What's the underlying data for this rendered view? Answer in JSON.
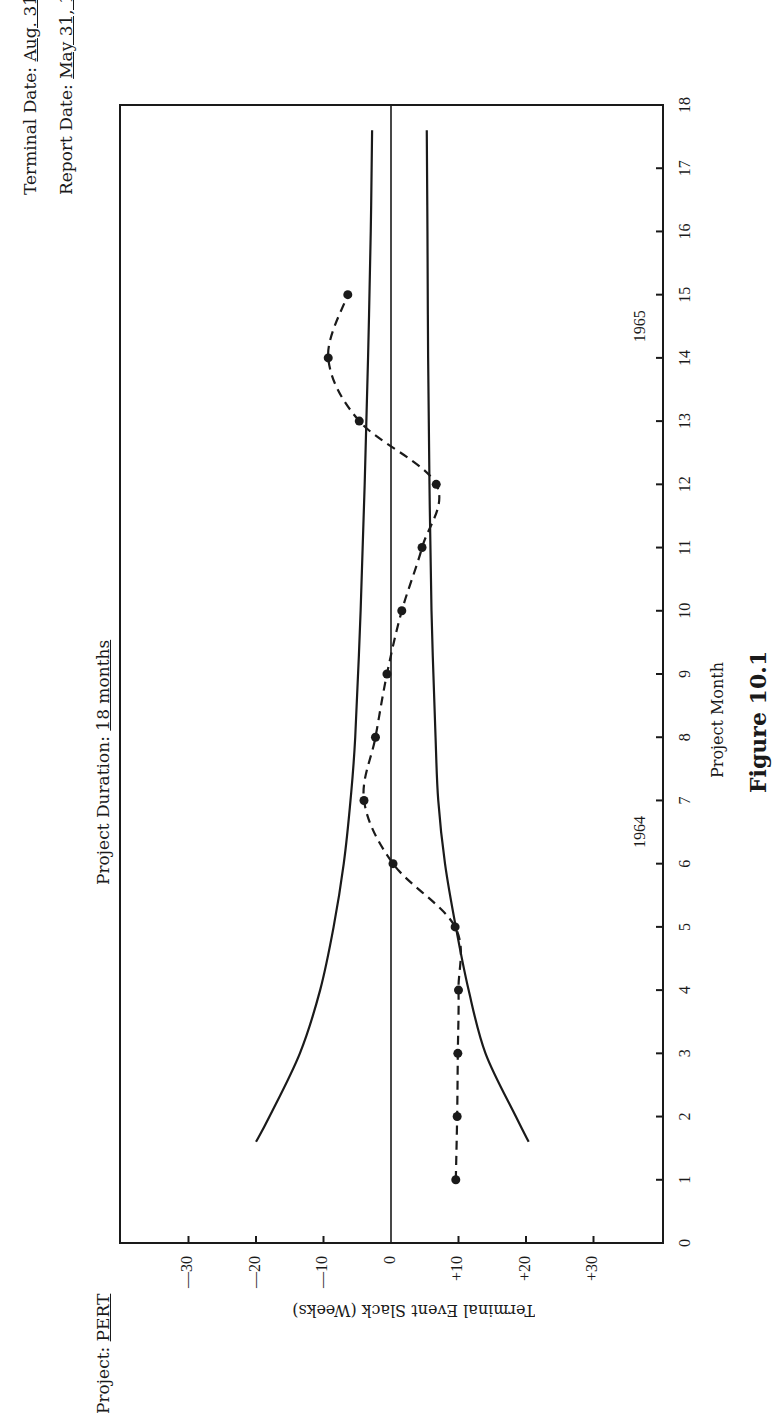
{
  "header": {
    "project_label": "Project:",
    "project_value": "PERT",
    "duration_label": "Project Duration:",
    "duration_value": "18 months",
    "terminal_label": "Terminal Date:",
    "terminal_value": "Aug. 31, 1965",
    "report_label": "Report Date:",
    "report_value": "May 31, 1965"
  },
  "figure_caption": "Figure 10.1",
  "year_labels": [
    {
      "label": "1964",
      "month": 6.5
    },
    {
      "label": "1965",
      "month": 14.5
    }
  ],
  "chart_data": {
    "type": "line",
    "orientation": "rotated 90° counter-clockwise on page (x-axis runs vertically, y-axis horizontally)",
    "title": "",
    "xlabel": "Project Month",
    "ylabel": "Terminal Event Slack (Weeks)",
    "xlim": [
      0,
      18
    ],
    "ylim": [
      -40,
      40
    ],
    "x_ticks": [
      0,
      1,
      2,
      3,
      4,
      5,
      6,
      7,
      8,
      9,
      10,
      11,
      12,
      13,
      14,
      15,
      16,
      17,
      18
    ],
    "y_ticks": [
      -30,
      -20,
      -10,
      0,
      10,
      20,
      30
    ],
    "y_tick_labels": [
      "—30",
      "—20",
      "—10",
      "0",
      "+10",
      "+20",
      "+30"
    ],
    "grid": false,
    "zero_line": true,
    "series": [
      {
        "name": "Terminal event slack (reported)",
        "style": "dashed with markers",
        "x": [
          1,
          2,
          3,
          4,
          5,
          6,
          7,
          8,
          9,
          10,
          11,
          12,
          13,
          14,
          15
        ],
        "values": [
          9.6,
          9.8,
          9.9,
          10,
          9.5,
          0.3,
          -4,
          -2.3,
          -0.6,
          1.6,
          4.6,
          6.7,
          -4.7,
          -9.3,
          -6.4
        ]
      },
      {
        "name": "Upper control boundary (negative slack)",
        "style": "solid",
        "x": [
          1.6,
          2,
          3,
          4,
          5,
          6,
          7,
          8,
          10,
          12,
          14,
          16,
          17.6
        ],
        "values": [
          -20,
          -18,
          -13.5,
          -10.5,
          -8.5,
          -7,
          -6,
          -5.3,
          -4.5,
          -3.9,
          -3.4,
          -3,
          -2.8
        ]
      },
      {
        "name": "Lower control boundary (positive slack)",
        "style": "solid",
        "x": [
          1.6,
          2,
          3,
          4,
          5,
          6,
          7,
          8,
          10,
          12,
          14,
          16,
          17.6
        ],
        "values": [
          20.4,
          18.5,
          14,
          11.5,
          9.6,
          8,
          7,
          6.6,
          6,
          5.7,
          5.5,
          5.4,
          5.3
        ]
      }
    ]
  }
}
